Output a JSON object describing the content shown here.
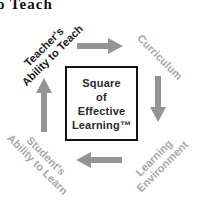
{
  "heading": {
    "cropped_text": "o Teach"
  },
  "diagram": {
    "center_box": {
      "text": "Square\nof\nEffective\nLearning™",
      "border_color": "#141414",
      "text_color": "#2b2b2b"
    },
    "corners": {
      "top_left": {
        "text": "Teacher's\nAbility to Teach",
        "color": "#1c1c1c",
        "rotation_deg": -45
      },
      "top_right": {
        "text": "Curriculum",
        "color": "#a8a8a8",
        "rotation_deg": 45
      },
      "bottom_right": {
        "text": "Learning\nEnvironment",
        "color": "#a8a8a8",
        "rotation_deg": -45
      },
      "bottom_left": {
        "text": "Student's\nAbility to Learn",
        "color": "#a8a8a8",
        "rotation_deg": 45
      }
    },
    "arrows": {
      "color": "#949494",
      "top_direction": "right",
      "right_direction": "down",
      "bottom_direction": "left",
      "left_direction": "up"
    }
  }
}
